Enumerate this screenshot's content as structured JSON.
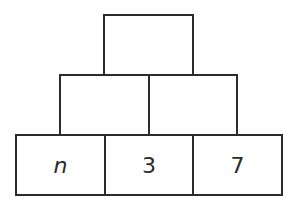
{
  "diagram": {
    "type": "number-pyramid",
    "rows": [
      {
        "row": "top",
        "cells": [
          {
            "value": ""
          }
        ]
      },
      {
        "row": "middle",
        "cells": [
          {
            "value": ""
          },
          {
            "value": ""
          }
        ]
      },
      {
        "row": "bottom",
        "cells": [
          {
            "value": "n",
            "italic": true
          },
          {
            "value": "3"
          },
          {
            "value": "7"
          }
        ]
      }
    ],
    "colors": {
      "stroke": "#2b2b2b",
      "background": "#ffffff"
    }
  }
}
